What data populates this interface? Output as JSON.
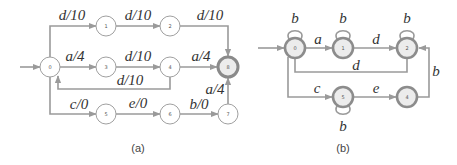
{
  "panel_a": {
    "caption": "(a)",
    "nodes": [
      {
        "id": "0",
        "label": "0"
      },
      {
        "id": "1",
        "label": "1"
      },
      {
        "id": "2",
        "label": "2"
      },
      {
        "id": "3",
        "label": "3"
      },
      {
        "id": "4",
        "label": "4"
      },
      {
        "id": "5",
        "label": "5"
      },
      {
        "id": "6",
        "label": "6"
      },
      {
        "id": "7",
        "label": "7"
      },
      {
        "id": "8",
        "label": "8",
        "final": true
      }
    ],
    "edges": [
      {
        "from": "0",
        "to": "1",
        "label": "d/10"
      },
      {
        "from": "1",
        "to": "2",
        "label": "d/10"
      },
      {
        "from": "2",
        "to": "8",
        "label": "d/10"
      },
      {
        "from": "0",
        "to": "3",
        "label": "a/4"
      },
      {
        "from": "3",
        "to": "4",
        "label": "d/10"
      },
      {
        "from": "4",
        "to": "8",
        "label": "a/4"
      },
      {
        "from": "4",
        "to": "0",
        "label": "d/10"
      },
      {
        "from": "0",
        "to": "5",
        "label": "c/0"
      },
      {
        "from": "5",
        "to": "6",
        "label": "e/0"
      },
      {
        "from": "6",
        "to": "7",
        "label": "b/0"
      },
      {
        "from": "7",
        "to": "8",
        "label": "a/4"
      }
    ]
  },
  "panel_b": {
    "caption": "(b)",
    "nodes": [
      {
        "id": "0",
        "label": "0"
      },
      {
        "id": "1",
        "label": "1"
      },
      {
        "id": "2",
        "label": "2"
      },
      {
        "id": "5",
        "label": "5"
      },
      {
        "id": "4",
        "label": "4"
      }
    ],
    "edges": [
      {
        "from": "0",
        "to": "0",
        "label": "b"
      },
      {
        "from": "1",
        "to": "1",
        "label": "b"
      },
      {
        "from": "2",
        "to": "2",
        "label": "b"
      },
      {
        "from": "5",
        "to": "5",
        "label": "b"
      },
      {
        "from": "0",
        "to": "1",
        "label": "a"
      },
      {
        "from": "1",
        "to": "2",
        "label": "d"
      },
      {
        "from": "2",
        "to": "0",
        "label": "d"
      },
      {
        "from": "0",
        "to": "5",
        "label": "c"
      },
      {
        "from": "5",
        "to": "4",
        "label": "e"
      },
      {
        "from": "4",
        "to": "2",
        "label": "b"
      }
    ]
  }
}
